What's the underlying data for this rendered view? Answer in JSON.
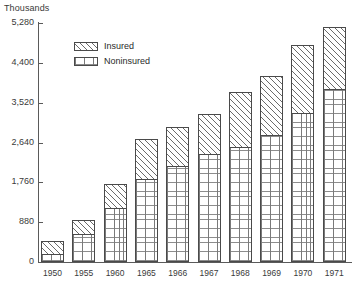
{
  "chart_data": {
    "type": "bar",
    "stacked": true,
    "title": "",
    "subtitle": "",
    "unit_label": "Thousands",
    "xlabel": "",
    "ylabel": "Thousands",
    "grid": false,
    "legend_position": "top-left-inside",
    "categories": [
      "1950",
      "1955",
      "1960",
      "1965",
      "1966",
      "1967",
      "1968",
      "1969",
      "1970",
      "1971"
    ],
    "ylim": [
      0,
      5280
    ],
    "yticks": [
      0,
      880,
      1760,
      2640,
      3520,
      4400,
      5280
    ],
    "ytick_labels": [
      "0",
      "880",
      "1,760",
      "2,640",
      "3,520",
      "4,400",
      "5,280"
    ],
    "series": [
      {
        "name": "Noninsured",
        "pattern": "vertical-grid",
        "values": [
          180,
          620,
          1190,
          1830,
          2120,
          2390,
          2530,
          2800,
          3290,
          3830
        ]
      },
      {
        "name": "Insured",
        "pattern": "diagonal-hatch",
        "values": [
          290,
          310,
          530,
          880,
          870,
          870,
          1230,
          1310,
          1510,
          1360
        ]
      }
    ],
    "totals": [
      470,
      930,
      1720,
      2710,
      2990,
      3260,
      3760,
      4110,
      4800,
      5190
    ],
    "annotations": []
  },
  "legend": {
    "items": [
      {
        "label": "Insured",
        "swatch": "diagonal-hatch-swatch"
      },
      {
        "label": "Noninsured",
        "swatch": "vertical-grid-swatch"
      }
    ]
  },
  "axis": {
    "unit_label": "Thousands"
  }
}
